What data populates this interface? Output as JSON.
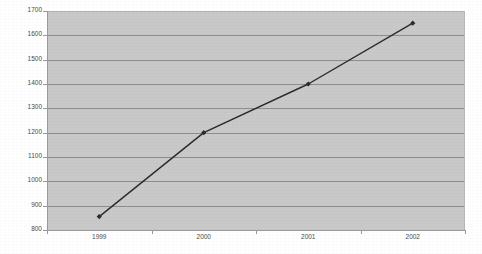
{
  "chart_data": {
    "type": "line",
    "title": "",
    "subtitle": "",
    "xlabel": "",
    "ylabel": "",
    "categories": [
      "1999",
      "2000",
      "2001",
      "2002"
    ],
    "series": [
      {
        "name": "series-1",
        "values": [
          855,
          1200,
          1400,
          1650
        ]
      }
    ],
    "ylim": [
      800,
      1700
    ],
    "ytick_labels": [
      "1700",
      "1600",
      "1500",
      "1400",
      "1300",
      "1200",
      "1100",
      "1000",
      "900",
      "800"
    ],
    "ytick_values": [
      1700,
      1600,
      1500,
      1400,
      1300,
      1200,
      1100,
      1000,
      900,
      800
    ],
    "ytick_interval": 100,
    "grid": true,
    "grid_axis": "y",
    "legend": false,
    "legend_position": "none",
    "marker": "diamond",
    "annotations": []
  },
  "style": {
    "plot_background": "#c9c9c9",
    "page_background": "#ffffff",
    "gridline_color": "#8e8e8e",
    "axis_color": "#9a9a9a",
    "series_color": "#2b2b2b",
    "label_color": "#4a4a4a"
  }
}
